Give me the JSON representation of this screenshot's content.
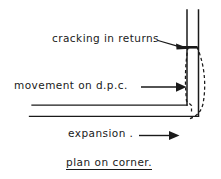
{
  "figure": {
    "caption": "plan on corner.",
    "annotations": [
      {
        "id": "cracking",
        "text": "cracking in returns",
        "leader": "arrow-down-right"
      },
      {
        "id": "movement",
        "text": "movement on d.p.c.",
        "leader": "arrow-right"
      },
      {
        "id": "expansion",
        "text": "expansion .",
        "leader": "arrow-right"
      }
    ],
    "colors": {
      "ink": "#1a1a1a",
      "background": "#ffffff"
    },
    "geometry": {
      "vertical_wall_lines_x": [
        187,
        198
      ],
      "vertical_wall_top_y": 10,
      "horizontal_wall_lines_y": [
        105,
        116
      ],
      "horizontal_wall_left_x": 32,
      "crack_marker_y": 47,
      "dashed_deflection": "two curved dashed lines bowing outward from the corner"
    }
  }
}
